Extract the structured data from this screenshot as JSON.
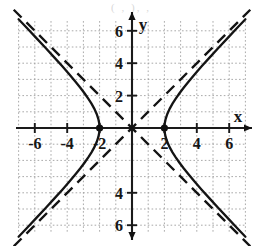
{
  "top_artifact": "( , ),           ,",
  "figure": {
    "title": "",
    "background_color": "#ffffff",
    "axis_color": "#1a1a1a",
    "grid_color": "#9a9a9a",
    "curve_color": "#141414",
    "asymptote_color": "#141414",
    "vertex_color": "#111111",
    "x_axis_label": "x",
    "y_axis_label": "y",
    "x_tick_labels": [
      "-6",
      "-4",
      "-2",
      "2",
      "4",
      "6"
    ],
    "y_tick_labels": [
      "6",
      "4",
      "2",
      "-4",
      "-6"
    ]
  },
  "chart_data": {
    "type": "line",
    "title": "",
    "xlabel": "x",
    "ylabel": "y",
    "xlim": [
      -7,
      7
    ],
    "ylim": [
      -7,
      7
    ],
    "xticks": [
      -6,
      -4,
      -2,
      2,
      4,
      6
    ],
    "yticks": [
      6,
      4,
      2,
      -4,
      -6
    ],
    "grid": true,
    "grid_style": "dotted",
    "grid_spacing": 1,
    "legend": "none",
    "equation": "x^2/4 - y^2/4 = 1",
    "conic_type": "hyperbola",
    "orientation": "horizontal",
    "center": [
      0,
      0
    ],
    "a": 2,
    "b": 2,
    "vertices": [
      [
        -2,
        0
      ],
      [
        2,
        0
      ]
    ],
    "asymptote_slopes": [
      1,
      -1
    ],
    "annotations": [
      {
        "label": "vertex",
        "x": -2,
        "y": 0,
        "marker": "filled-dot"
      },
      {
        "label": "vertex",
        "x": 2,
        "y": 0,
        "marker": "filled-dot"
      }
    ],
    "series": [
      {
        "name": "right branch",
        "style": "solid",
        "points": [
          [
            2,
            0
          ],
          [
            2.02,
            0.28
          ],
          [
            2.08,
            0.57
          ],
          [
            2.18,
            0.87
          ],
          [
            2.33,
            1.2
          ],
          [
            2.5,
            1.5
          ],
          [
            2.7,
            1.81
          ],
          [
            2.92,
            2.13
          ],
          [
            3.2,
            2.5
          ],
          [
            3.5,
            2.87
          ],
          [
            3.9,
            3.35
          ],
          [
            4.3,
            3.81
          ],
          [
            4.8,
            4.36
          ],
          [
            5.3,
            4.91
          ],
          [
            5.9,
            5.55
          ],
          [
            6.5,
            6.19
          ],
          [
            7,
            6.71
          ]
        ]
      },
      {
        "name": "right branch lower",
        "style": "solid",
        "points": [
          [
            2,
            0
          ],
          [
            2.02,
            -0.28
          ],
          [
            2.08,
            -0.57
          ],
          [
            2.18,
            -0.87
          ],
          [
            2.33,
            -1.2
          ],
          [
            2.5,
            -1.5
          ],
          [
            2.7,
            -1.81
          ],
          [
            2.92,
            -2.13
          ],
          [
            3.2,
            -2.5
          ],
          [
            3.5,
            -2.87
          ],
          [
            3.9,
            -3.35
          ],
          [
            4.3,
            -3.81
          ],
          [
            4.8,
            -4.36
          ],
          [
            5.3,
            -4.91
          ],
          [
            5.9,
            -5.55
          ],
          [
            6.5,
            -6.19
          ],
          [
            7,
            -6.71
          ]
        ]
      },
      {
        "name": "left branch",
        "style": "solid",
        "points": [
          [
            -2,
            0
          ],
          [
            -2.02,
            0.28
          ],
          [
            -2.08,
            0.57
          ],
          [
            -2.18,
            0.87
          ],
          [
            -2.33,
            1.2
          ],
          [
            -2.5,
            1.5
          ],
          [
            -2.7,
            1.81
          ],
          [
            -2.92,
            2.13
          ],
          [
            -3.2,
            2.5
          ],
          [
            -3.5,
            2.87
          ],
          [
            -3.9,
            3.35
          ],
          [
            -4.3,
            3.81
          ],
          [
            -4.8,
            4.36
          ],
          [
            -5.3,
            4.91
          ],
          [
            -5.9,
            5.55
          ],
          [
            -6.5,
            6.19
          ],
          [
            -7,
            6.71
          ]
        ]
      },
      {
        "name": "left branch lower",
        "style": "solid",
        "points": [
          [
            -2,
            0
          ],
          [
            -2.02,
            -0.28
          ],
          [
            -2.08,
            -0.57
          ],
          [
            -2.18,
            -0.87
          ],
          [
            -2.33,
            -1.2
          ],
          [
            -2.5,
            -1.5
          ],
          [
            -2.7,
            -1.81
          ],
          [
            -2.92,
            -2.13
          ],
          [
            -3.2,
            -2.5
          ],
          [
            -3.5,
            -2.87
          ],
          [
            -3.9,
            -3.35
          ],
          [
            -4.3,
            -3.81
          ],
          [
            -4.8,
            -4.36
          ],
          [
            -5.3,
            -4.91
          ],
          [
            -5.9,
            -5.55
          ],
          [
            -6.5,
            -6.19
          ],
          [
            -7,
            -6.71
          ]
        ]
      },
      {
        "name": "asymptote y = x",
        "style": "dashed",
        "points": [
          [
            -7.3,
            -7.3
          ],
          [
            7.3,
            7.3
          ]
        ]
      },
      {
        "name": "asymptote y = -x",
        "style": "dashed",
        "points": [
          [
            -7.3,
            7.3
          ],
          [
            7.3,
            -7.3
          ]
        ]
      }
    ]
  }
}
